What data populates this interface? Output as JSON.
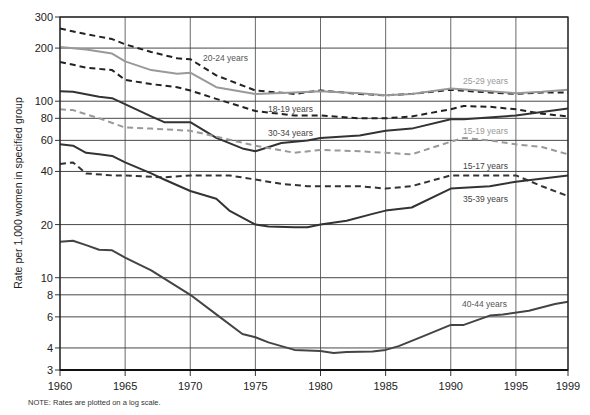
{
  "chart_data": {
    "type": "line",
    "title": "",
    "xlabel": "",
    "ylabel": "Rate per 1,000 women in specified group",
    "yscale": "log",
    "ylim": [
      3,
      300
    ],
    "xlim": [
      1960,
      1999
    ],
    "grid": true,
    "x_ticks": [
      1960,
      1965,
      1970,
      1975,
      1980,
      1985,
      1990,
      1995,
      1999
    ],
    "y_ticks": [
      3,
      4,
      6,
      8,
      10,
      20,
      40,
      60,
      80,
      100,
      200,
      300
    ],
    "note": "NOTE: Rates are plotted on a log scale.",
    "series": [
      {
        "name": "20-24 years",
        "style": "dashed",
        "color": "#222222",
        "x": [
          1960,
          1962,
          1964,
          1965,
          1967,
          1969,
          1970,
          1972,
          1975,
          1978,
          1980,
          1983,
          1985,
          1987,
          1990,
          1993,
          1995,
          1997,
          1999
        ],
        "values": [
          258,
          240,
          225,
          210,
          190,
          175,
          173,
          140,
          115,
          110,
          115,
          110,
          108,
          110,
          116,
          112,
          110,
          112,
          112
        ]
      },
      {
        "name": "25-29 years",
        "style": "solid",
        "color": "#999999",
        "x": [
          1960,
          1962,
          1964,
          1965,
          1967,
          1969,
          1970,
          1972,
          1975,
          1978,
          1980,
          1983,
          1985,
          1987,
          1990,
          1993,
          1995,
          1997,
          1999
        ],
        "values": [
          203,
          196,
          186,
          168,
          150,
          143,
          145,
          120,
          110,
          112,
          114,
          111,
          108,
          110,
          118,
          114,
          111,
          113,
          116
        ]
      },
      {
        "name": "18-19 years",
        "style": "dashed",
        "color": "#222222",
        "x": [
          1960,
          1962,
          1964,
          1965,
          1967,
          1969,
          1970,
          1972,
          1975,
          1978,
          1980,
          1983,
          1985,
          1987,
          1990,
          1991,
          1993,
          1995,
          1997,
          1999
        ],
        "values": [
          167,
          155,
          150,
          132,
          125,
          120,
          115,
          103,
          88,
          83,
          83,
          80,
          80,
          82,
          90,
          94,
          93,
          90,
          85,
          82
        ]
      },
      {
        "name": "30-34 years",
        "style": "solid",
        "color": "#333333",
        "x": [
          1960,
          1961,
          1963,
          1964,
          1967,
          1968,
          1970,
          1972,
          1974,
          1975,
          1977,
          1979,
          1980,
          1983,
          1985,
          1987,
          1990,
          1991,
          1995,
          1999
        ],
        "values": [
          114,
          113,
          106,
          104,
          82,
          76,
          76,
          62,
          54,
          52,
          58,
          60,
          62,
          64,
          68,
          70,
          79,
          79,
          83,
          91
        ]
      },
      {
        "name": "15-19 years",
        "style": "dashed",
        "color": "#999999",
        "x": [
          1960,
          1961,
          1963,
          1965,
          1967,
          1970,
          1972,
          1975,
          1978,
          1980,
          1983,
          1985,
          1987,
          1990,
          1991,
          1993,
          1995,
          1997,
          1999
        ],
        "values": [
          90,
          89,
          80,
          71,
          70,
          68,
          63,
          56,
          51,
          53,
          52,
          51,
          50,
          59,
          62,
          60,
          57,
          55,
          50
        ]
      },
      {
        "name": "15-17 years",
        "style": "dashed",
        "color": "#333333",
        "x": [
          1960,
          1961,
          1962,
          1964,
          1965,
          1968,
          1970,
          1973,
          1975,
          1977,
          1979,
          1980,
          1983,
          1985,
          1987,
          1990,
          1991,
          1993,
          1995,
          1997,
          1999
        ],
        "values": [
          44,
          45,
          39,
          38,
          38,
          37,
          38,
          38,
          36,
          34,
          33,
          33,
          33,
          32,
          33,
          38,
          38,
          38,
          38,
          33,
          29
        ]
      },
      {
        "name": "35-39 years",
        "style": "solid",
        "color": "#333333",
        "x": [
          1960,
          1961,
          1962,
          1963,
          1964,
          1965,
          1967,
          1968,
          1970,
          1972,
          1973,
          1975,
          1976,
          1978,
          1979,
          1980,
          1982,
          1984,
          1985,
          1987,
          1990,
          1993,
          1995,
          1999
        ],
        "values": [
          57,
          56,
          51,
          50,
          49,
          45,
          39,
          36,
          31,
          28,
          24,
          20,
          19.5,
          19.3,
          19.3,
          20,
          21,
          23,
          24,
          25,
          32,
          33,
          35,
          38
        ]
      },
      {
        "name": "40-44 years",
        "style": "solid",
        "color": "#444444",
        "x": [
          1960,
          1961,
          1962,
          1963,
          1964,
          1965,
          1967,
          1970,
          1972,
          1974,
          1975,
          1976,
          1977,
          1978,
          1980,
          1981,
          1982,
          1984,
          1985,
          1986,
          1988,
          1990,
          1991,
          1993,
          1994,
          1996,
          1998,
          1999
        ],
        "values": [
          16,
          16.2,
          15.3,
          14.4,
          14.3,
          13,
          11,
          8,
          6.2,
          4.8,
          4.6,
          4.3,
          4.1,
          3.9,
          3.85,
          3.75,
          3.8,
          3.82,
          3.9,
          4.1,
          4.7,
          5.4,
          5.4,
          6.1,
          6.2,
          6.5,
          7.1,
          7.3
        ]
      }
    ],
    "series_labels": [
      {
        "text": "20-24 years",
        "x": 203,
        "y": 61,
        "color": "#555555"
      },
      {
        "text": "25-29 years",
        "x": 463,
        "y": 84,
        "color": "#999999"
      },
      {
        "text": "18-19 years",
        "x": 268,
        "y": 112,
        "color": "#444444"
      },
      {
        "text": "30-34 years",
        "x": 268,
        "y": 136,
        "color": "#444444"
      },
      {
        "text": "15-19 years",
        "x": 463,
        "y": 134,
        "color": "#999999"
      },
      {
        "text": "15-17 years",
        "x": 463,
        "y": 169,
        "color": "#444444"
      },
      {
        "text": "35-39 years",
        "x": 463,
        "y": 202,
        "color": "#444444"
      },
      {
        "text": "40-44 years",
        "x": 462,
        "y": 307,
        "color": "#555555"
      }
    ]
  }
}
